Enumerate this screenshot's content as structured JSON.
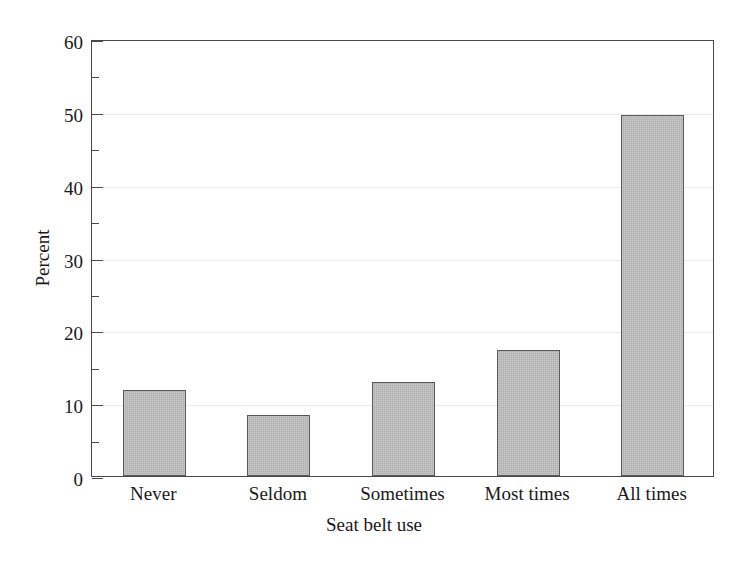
{
  "chart_data": {
    "type": "bar",
    "title": "",
    "subtitle": "",
    "categories": [
      "Never",
      "Seldom",
      "Sometimes",
      "Most times",
      "All times"
    ],
    "values": [
      11.8,
      8.4,
      12.9,
      17.3,
      49.6
    ],
    "xlabel": "Seat belt use",
    "ylabel": "Percent",
    "ylim": [
      0,
      60
    ],
    "y_major_ticks": [
      0,
      10,
      20,
      30,
      40,
      50,
      60
    ],
    "y_minor_ticks": [
      5,
      15,
      25,
      35,
      45,
      55
    ],
    "y_tick_labels": [
      "0",
      "10",
      "20",
      "30",
      "40",
      "50",
      "60"
    ],
    "grid": "horizontal-major-only",
    "legend": "none",
    "bar_fill_color": "#b4b4b4",
    "bar_border_color": "#595959",
    "axis_color": "#4a4a4a",
    "gridline_color": "#ebe9e9",
    "background_color": "#ffffff"
  }
}
